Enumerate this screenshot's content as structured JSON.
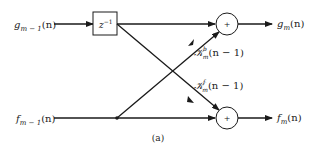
{
  "diagram": {
    "caption": "(a)",
    "inputs": {
      "g_prev": {
        "base": "g",
        "sub": "m − 1",
        "arg": "(n)"
      },
      "f_prev": {
        "base": "f",
        "sub": "m − 1",
        "arg": "(n)"
      }
    },
    "outputs": {
      "g_out": {
        "base": "g",
        "sub": "m",
        "arg": "(n)"
      },
      "f_out": {
        "base": "f",
        "sub": "m",
        "arg": "(n)"
      }
    },
    "delay": {
      "base": "z",
      "sup": "−1"
    },
    "adders": {
      "top": "+",
      "bottom": "+"
    },
    "coefficients": {
      "backward": {
        "base": "𝒦",
        "sup": "b",
        "sub": "m",
        "arg": "(n − 1)"
      },
      "forward": {
        "base": "𝒦",
        "sup": "f",
        "sub": "m",
        "arg": "(n − 1)"
      }
    },
    "colors": {
      "stroke": "#1a1a1a",
      "text": "#222222",
      "background": "#ffffff"
    }
  }
}
